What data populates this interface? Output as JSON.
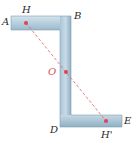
{
  "diagram": {
    "type": "z-section cross-section",
    "colors": {
      "section_fill_light": "#c9dbe6",
      "section_fill_dark": "#8fb0c4",
      "section_edge": "#6f8fa3",
      "axis_line": "#e07070",
      "points": "#e0405a",
      "label_text": "#2a2a2a",
      "label_o": "#d9534f"
    },
    "labels": {
      "A": "A",
      "B": "B",
      "D": "D",
      "E": "E",
      "H": "H",
      "O": "O",
      "H_prime": "H'"
    },
    "points": [
      {
        "name": "H",
        "x": 26,
        "y": 23
      },
      {
        "name": "O",
        "x": 66,
        "y": 72
      },
      {
        "name": "H'",
        "x": 106,
        "y": 121
      }
    ],
    "line": {
      "from": "H",
      "to": "H'",
      "style": "dashed"
    }
  }
}
